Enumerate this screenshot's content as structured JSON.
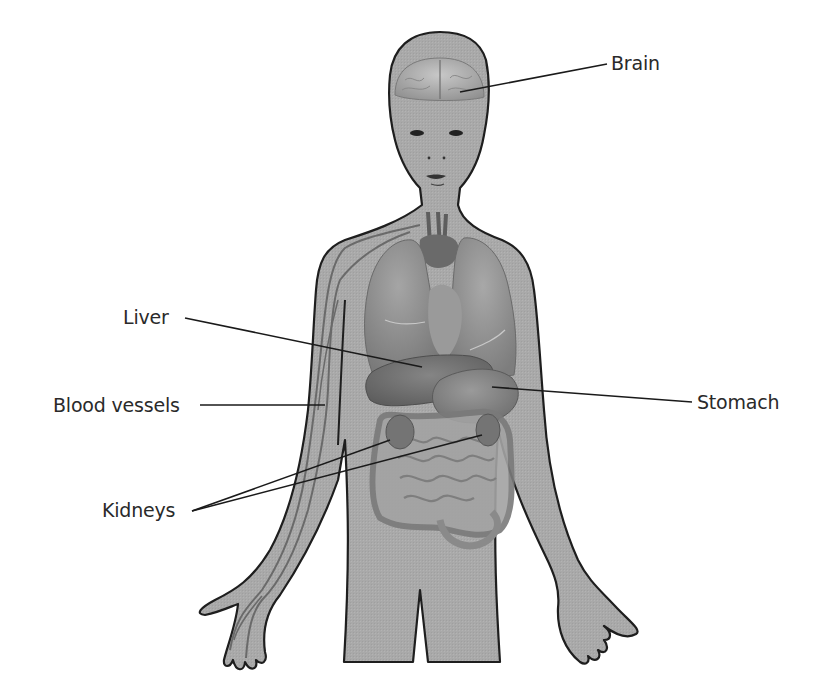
{
  "diagram": {
    "colors": {
      "background": "#ffffff",
      "skin": "#a9a9a9",
      "outline": "#1e1e1e",
      "organ_dark": "#6e6e6e",
      "organ_mid": "#8a8a8a",
      "organ_light": "#bdbdbd",
      "vessel": "#6a6a6a",
      "leader_line": "#1a1a1a",
      "label_text": "#2a2a2a"
    },
    "labels": [
      {
        "id": "brain",
        "text": "Brain"
      },
      {
        "id": "liver",
        "text": "Liver"
      },
      {
        "id": "blood-vessels",
        "text": "Blood vessels"
      },
      {
        "id": "stomach",
        "text": "Stomach"
      },
      {
        "id": "kidneys",
        "text": "Kidneys"
      }
    ]
  }
}
